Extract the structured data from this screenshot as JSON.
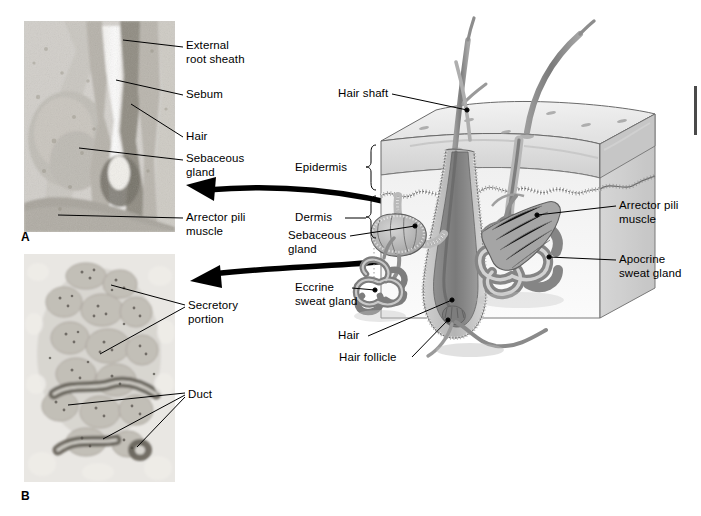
{
  "figure": {
    "panels": [
      {
        "id": "A",
        "letter": "A",
        "caption": "Hair follicle with sebaceous gland, light micrograph"
      },
      {
        "id": "B",
        "letter": "B",
        "caption": "Eccrine sweat gland, light micrograph"
      }
    ]
  },
  "panel_a": {
    "letter": "A",
    "labels": [
      {
        "name": "external-root-sheath",
        "text": "External\nroot sheath"
      },
      {
        "name": "sebum",
        "text": "Sebum"
      },
      {
        "name": "hair",
        "text": "Hair"
      },
      {
        "name": "sebaceous-gland",
        "text": "Sebaceous\ngland"
      },
      {
        "name": "arrector-pili-muscle",
        "text": "Arrector pili\nmuscle"
      }
    ]
  },
  "panel_b": {
    "letter": "B",
    "labels": [
      {
        "name": "secretory-portion",
        "text": "Secretory\nportion"
      },
      {
        "name": "duct",
        "text": "Duct"
      }
    ]
  },
  "diagram": {
    "labels_left": [
      {
        "name": "hair-shaft",
        "text": "Hair shaft"
      },
      {
        "name": "epidermis",
        "text": "Epidermis"
      },
      {
        "name": "dermis",
        "text": "Dermis"
      },
      {
        "name": "sebaceous-gland",
        "text": "Sebaceous\ngland"
      },
      {
        "name": "eccrine-sweat-gland",
        "text": "Eccrine\nsweat gland"
      },
      {
        "name": "hair",
        "text": "Hair"
      },
      {
        "name": "hair-follicle",
        "text": "Hair follicle"
      }
    ],
    "labels_right": [
      {
        "name": "arrector-pili-muscle",
        "text": "Arrector pili\nmuscle"
      },
      {
        "name": "apocrine-sweat-gland",
        "text": "Apocrine\nsweat gland"
      }
    ]
  },
  "colors": {
    "background": "#ffffff",
    "text": "#000000",
    "leader": "#000000",
    "arrow": "#000000",
    "epidermis_fill": "#d9d9d9",
    "dermis_fill": "#eeeeee",
    "hair_fill": "#8f8f8f",
    "follicle_fill": "#b9b9b9",
    "gland_fill": "#c3c3c3",
    "muscle_fill": "#a8a8a8",
    "edge_bar": "#4a4a4a"
  }
}
